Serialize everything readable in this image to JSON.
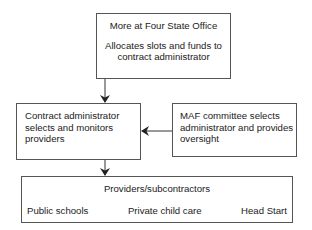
{
  "diagram": {
    "top_box": {
      "title": "More at Four State Office",
      "description": "Allocates slots and funds to contract administrator"
    },
    "middle_left_box": {
      "text": "Contract administrator selects and monitors providers"
    },
    "middle_right_box": {
      "text": "MAF committee selects administrator and provides oversight"
    },
    "bottom_box": {
      "title": "Providers/subcontractors",
      "items": [
        "Public schools",
        "Private child care",
        "Head Start"
      ]
    },
    "edges": [
      {
        "from": "top_box",
        "to": "middle_left_box",
        "direction": "down"
      },
      {
        "from": "middle_right_box",
        "to": "middle_left_box",
        "direction": "left"
      },
      {
        "from": "middle_left_box",
        "to": "bottom_box",
        "direction": "down"
      }
    ],
    "colors": {
      "border": "#555555",
      "arrow": "#222222",
      "text": "#222222",
      "background": "#ffffff"
    }
  }
}
